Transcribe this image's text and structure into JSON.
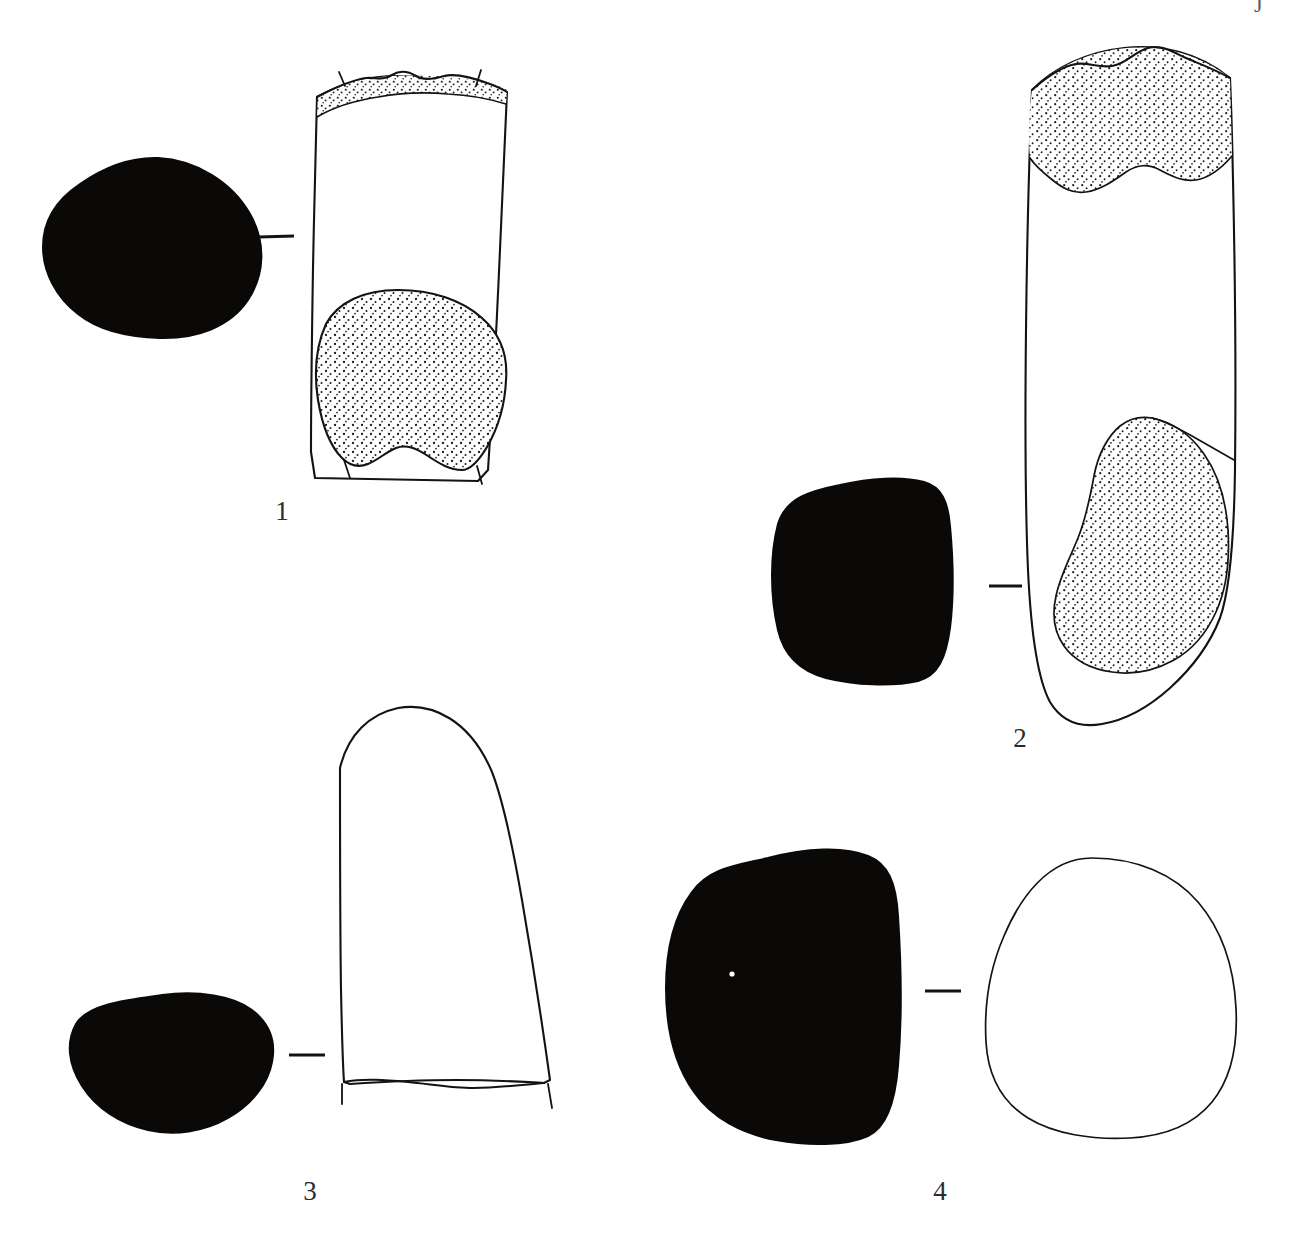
{
  "plate": {
    "title": "Archaeological artifact illustration plate",
    "background_color": "#ffffff",
    "ink_color": "#15120f",
    "section_fill_color": "#0a0908",
    "corner_mark": "J",
    "width": 1309,
    "height": 1244
  },
  "figures": [
    {
      "id": "figure-1",
      "label": "1",
      "label_x": 262,
      "label_y": 498,
      "section": {
        "name": "cross-section-1",
        "shape": "teardrop",
        "fill": "solid-black",
        "x": 42,
        "y": 158,
        "width": 225,
        "height": 182
      },
      "connector": {
        "x1": 259,
        "y1": 237,
        "x2": 294,
        "y2": 236
      },
      "profile": {
        "name": "profile-1",
        "shape": "tapered-column",
        "stippled_zones": [
          "top-band",
          "lower-lobe"
        ],
        "break_marks": true,
        "x": 305,
        "y": 62,
        "width": 210,
        "height": 425
      }
    },
    {
      "id": "figure-2",
      "label": "2",
      "label_x": 1000,
      "label_y": 725,
      "section": {
        "name": "cross-section-2",
        "shape": "rounded-square",
        "fill": "solid-black",
        "x": 738,
        "y": 483,
        "width": 196,
        "height": 198
      },
      "connector": {
        "x1": 989,
        "y1": 586,
        "x2": 1022,
        "y2": 586
      },
      "profile": {
        "name": "profile-2",
        "shape": "long-column",
        "stippled_zones": [
          "top-irregular",
          "lower-right-lobe"
        ],
        "break_marks": false,
        "x": 1026,
        "y": 43,
        "width": 215,
        "height": 678
      }
    },
    {
      "id": "figure-3",
      "label": "3",
      "label_x": 290,
      "label_y": 1178,
      "section": {
        "name": "cross-section-3",
        "shape": "horizontal-oval",
        "fill": "solid-black",
        "x": 62,
        "y": 995,
        "width": 195,
        "height": 140
      },
      "connector": {
        "x1": 289,
        "y1": 1055,
        "x2": 325,
        "y2": 1055
      },
      "profile": {
        "name": "profile-3",
        "shape": "dome-top-taper",
        "stippled_zones": [],
        "break_marks": true,
        "x": 336,
        "y": 702,
        "width": 206,
        "height": 388
      }
    },
    {
      "id": "figure-4",
      "label": "4",
      "label_x": 920,
      "label_y": 1178,
      "section": {
        "name": "cross-section-4",
        "shape": "rounded-square-tall",
        "fill": "solid-black",
        "x": 650,
        "y": 848,
        "width": 247,
        "height": 296
      },
      "connector": {
        "x1": 925,
        "y1": 991,
        "x2": 961,
        "y2": 991
      },
      "profile": {
        "name": "profile-4",
        "shape": "ovoid",
        "stippled_zones": [],
        "break_marks": false,
        "x": 988,
        "y": 858,
        "width": 250,
        "height": 256
      }
    }
  ]
}
